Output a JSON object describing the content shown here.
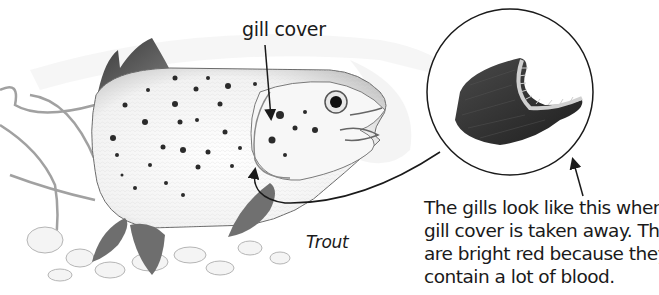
{
  "figure": {
    "subject": "Trout",
    "labels": {
      "gill_cover": "gill cover",
      "species": "Trout"
    },
    "caption": {
      "lines": [
        "The gills look like this when the",
        "gill cover is taken away. They",
        "are bright red because they",
        "contain a lot of blood."
      ]
    },
    "inset": {
      "shape": "circle",
      "content": "gills-closeup"
    },
    "colors": {
      "ink": "#1a1a1a",
      "fin": "#5a5a5a",
      "gill_dark": "#2e2e2e",
      "background": "#ffffff"
    }
  }
}
